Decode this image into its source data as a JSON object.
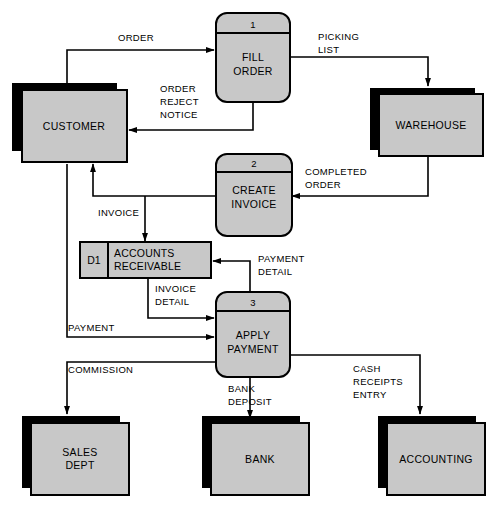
{
  "diagram": {
    "colors": {
      "fill": "#c8c8c8",
      "stroke": "#000000",
      "shadow": "#000000",
      "background": "#ffffff"
    },
    "entities": [
      {
        "id": "customer",
        "label": "CUSTOMER"
      },
      {
        "id": "warehouse",
        "label": "WAREHOUSE"
      },
      {
        "id": "sales-dept",
        "label_line1": "SALES",
        "label_line2": "DEPT"
      },
      {
        "id": "bank",
        "label": "BANK"
      },
      {
        "id": "accounting",
        "label": "ACCOUNTING"
      }
    ],
    "processes": [
      {
        "id": "fill-order",
        "number": "1",
        "label_line1": "FILL",
        "label_line2": "ORDER"
      },
      {
        "id": "create-invoice",
        "number": "2",
        "label_line1": "CREATE",
        "label_line2": "INVOICE"
      },
      {
        "id": "apply-payment",
        "number": "3",
        "label_line1": "APPLY",
        "label_line2": "PAYMENT"
      }
    ],
    "datastores": [
      {
        "id": "accounts-receivable",
        "code": "D1",
        "label_line1": "ACCOUNTS",
        "label_line2": "RECEIVABLE"
      }
    ],
    "flows": [
      {
        "id": "order",
        "label_line1": "ORDER",
        "label_line2": "",
        "label_line3": "",
        "from": "customer",
        "to": "fill-order"
      },
      {
        "id": "picking-list",
        "label_line1": "PICKING",
        "label_line2": "LIST",
        "label_line3": "",
        "from": "fill-order",
        "to": "warehouse"
      },
      {
        "id": "order-reject-notice",
        "label_line1": "ORDER",
        "label_line2": "REJECT",
        "label_line3": "NOTICE",
        "from": "fill-order",
        "to": "customer"
      },
      {
        "id": "completed-order",
        "label_line1": "COMPLETED",
        "label_line2": "ORDER",
        "label_line3": "",
        "from": "warehouse",
        "to": "create-invoice"
      },
      {
        "id": "invoice",
        "label_line1": "INVOICE",
        "label_line2": "",
        "label_line3": "",
        "from": "create-invoice",
        "to": "customer / accounts-receivable"
      },
      {
        "id": "invoice-detail",
        "label_line1": "INVOICE",
        "label_line2": "DETAIL",
        "label_line3": "",
        "from": "accounts-receivable",
        "to": "apply-payment"
      },
      {
        "id": "payment-detail",
        "label_line1": "PAYMENT",
        "label_line2": "DETAIL",
        "label_line3": "",
        "from": "apply-payment",
        "to": "accounts-receivable"
      },
      {
        "id": "payment",
        "label_line1": "PAYMENT",
        "label_line2": "",
        "label_line3": "",
        "from": "customer",
        "to": "apply-payment"
      },
      {
        "id": "commission",
        "label_line1": "COMMISSION",
        "label_line2": "",
        "label_line3": "",
        "from": "apply-payment",
        "to": "sales-dept"
      },
      {
        "id": "bank-deposit",
        "label_line1": "BANK",
        "label_line2": "DEPOSIT",
        "label_line3": "",
        "from": "apply-payment",
        "to": "bank"
      },
      {
        "id": "cash-receipts-entry",
        "label_line1": "CASH",
        "label_line2": "RECEIPTS",
        "label_line3": "ENTRY",
        "from": "apply-payment",
        "to": "accounting"
      }
    ]
  }
}
